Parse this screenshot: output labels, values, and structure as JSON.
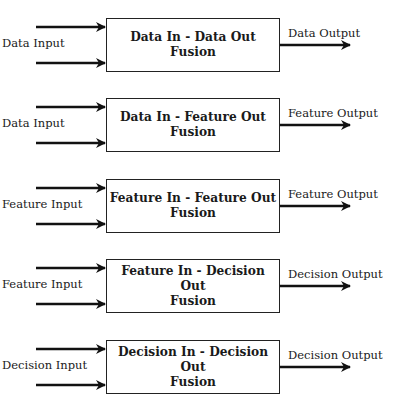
{
  "diagram": {
    "type": "fusion-levels",
    "rows": [
      {
        "input_label": "Data Input",
        "title_line1": "Data In - Data Out",
        "title_line2": "Fusion",
        "output_label": "Data Output"
      },
      {
        "input_label": "Data Input",
        "title_line1": "Data In - Feature Out",
        "title_line2": "Fusion",
        "output_label": "Feature Output"
      },
      {
        "input_label": "Feature Input",
        "title_line1": "Feature In - Feature Out",
        "title_line2": "Fusion",
        "output_label": "Feature Output"
      },
      {
        "input_label": "Feature Input",
        "title_line1": "Feature In - Decision Out",
        "title_line2": "Fusion",
        "output_label": "Decision Output"
      },
      {
        "input_label": "Decision Input",
        "title_line1": "Decision In - Decision Out",
        "title_line2": "Fusion",
        "output_label": "Decision Output"
      }
    ]
  }
}
